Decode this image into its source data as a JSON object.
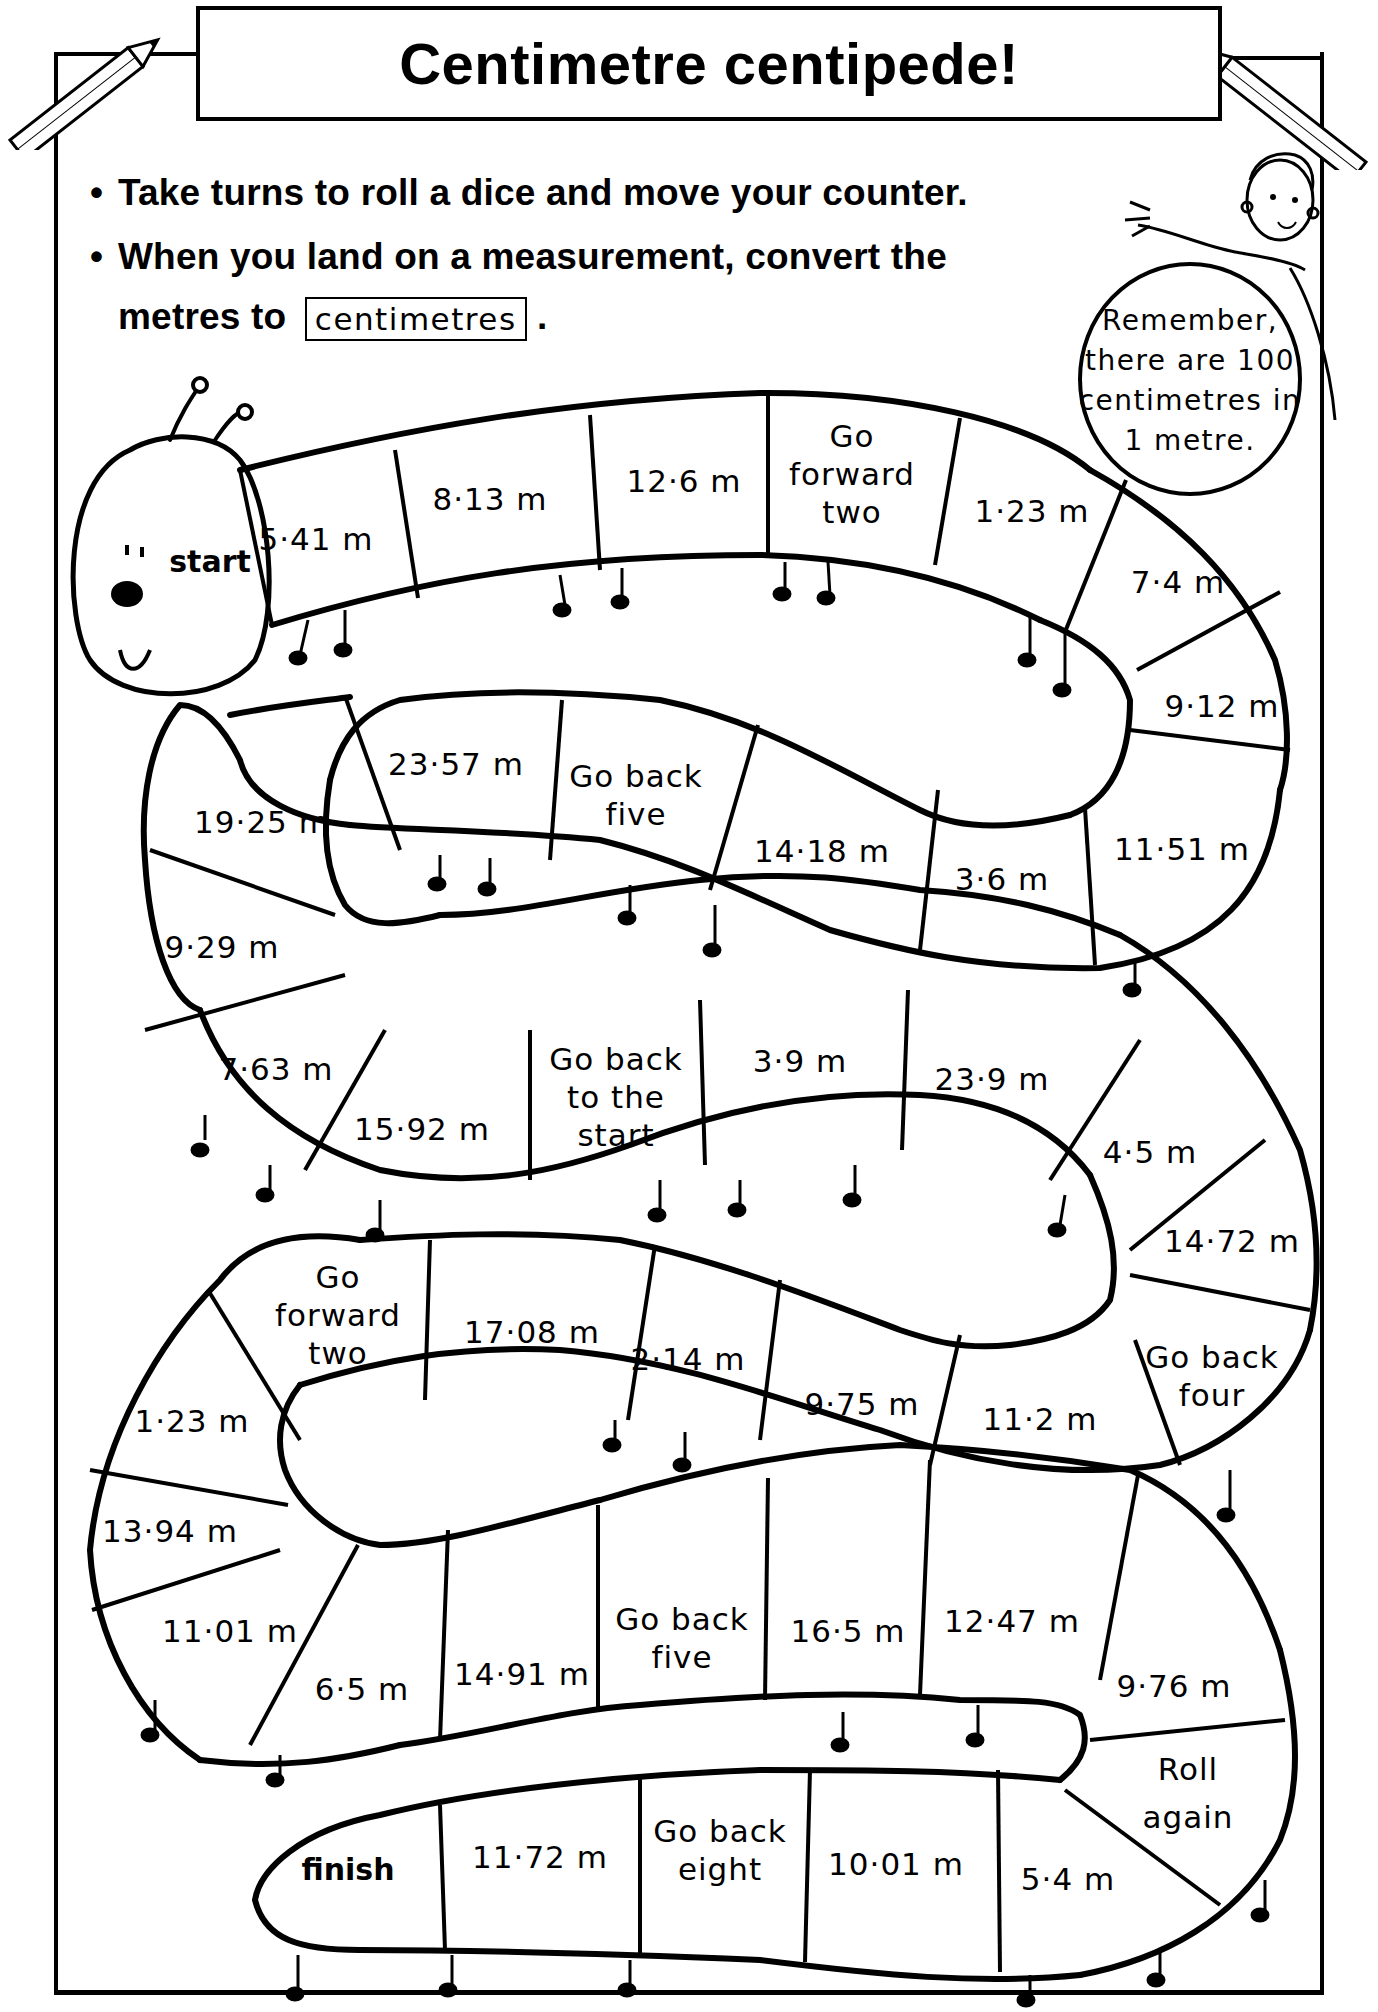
{
  "title": "Centimetre centipede!",
  "instructions": {
    "line1": "Take turns to roll a dice and move your counter.",
    "line2": "When you land on a measurement, convert the",
    "line3_prefix": "metres to",
    "line3_keyword": "centimetres",
    "line3_suffix": "."
  },
  "reminder": {
    "line1": "Remember,",
    "line2": "there are 100",
    "line3": "centimetres in",
    "line4": "1 metre."
  },
  "board": {
    "start_label": "start",
    "finish_label": "finish",
    "row1": [
      "5·41 m",
      "8·13 m",
      "12·6 m",
      "Go|forward|two",
      "1·23 m",
      "7·4 m",
      "9·12 m"
    ],
    "row2": [
      "11·51 m",
      "3·6 m",
      "14·18 m",
      "Go back|five",
      "23·57 m",
      "19·25 m",
      "9·29 m"
    ],
    "row3": [
      "7·63 m",
      "15·92 m",
      "Go back|to the|start",
      "3·9 m",
      "23·9 m",
      "4·5 m",
      "14·72 m"
    ],
    "row4": [
      "Go back|four",
      "11·2 m",
      "9·75 m",
      "2·14 m",
      "17·08 m",
      "Go|forward|two",
      "1·23 m"
    ],
    "row5": [
      "13·94 m",
      "11·01 m",
      "6·5 m",
      "14·91 m",
      "Go back|five",
      "16·5 m",
      "12·47 m",
      "9·76 m"
    ],
    "row6": [
      "Roll|again",
      "5·4 m",
      "10·01 m",
      "Go back|eight",
      "11·72 m"
    ]
  },
  "cells": {
    "r1c1": "5·41 m",
    "r1c2": "8·13 m",
    "r1c3": "12·6 m",
    "r1c4a": "Go",
    "r1c4b": "forward",
    "r1c4c": "two",
    "r1c5": "1·23 m",
    "r1c6": "7·4 m",
    "r1c7": "9·12 m",
    "r2c1": "11·51 m",
    "r2c2": "3·6 m",
    "r2c3": "14·18 m",
    "r2c4a": "Go back",
    "r2c4b": "five",
    "r2c5": "23·57 m",
    "r2c6": "19·25 m",
    "r2c7": "9·29 m",
    "r3c1": "7·63 m",
    "r3c2": "15·92 m",
    "r3c3a": "Go back",
    "r3c3b": "to the",
    "r3c3c": "start",
    "r3c4": "3·9 m",
    "r3c5": "23·9 m",
    "r3c6": "4·5 m",
    "r3c7": "14·72 m",
    "r4c1a": "Go back",
    "r4c1b": "four",
    "r4c2": "11·2 m",
    "r4c3": "9·75 m",
    "r4c4": "2·14 m",
    "r4c5": "17·08 m",
    "r4c6a": "Go",
    "r4c6b": "forward",
    "r4c6c": "two",
    "r4c7": "1·23 m",
    "r5c1": "13·94 m",
    "r5c2": "11·01 m",
    "r5c3": "6·5 m",
    "r5c4": "14·91 m",
    "r5c5a": "Go back",
    "r5c5b": "five",
    "r5c6": "16·5 m",
    "r5c7": "12·47 m",
    "r5c8": "9·76 m",
    "r6c1a": "Roll",
    "r6c1b": "again",
    "r6c2": "5·4 m",
    "r6c3": "10·01 m",
    "r6c4a": "Go back",
    "r6c4b": "eight",
    "r6c5": "11·72 m"
  }
}
